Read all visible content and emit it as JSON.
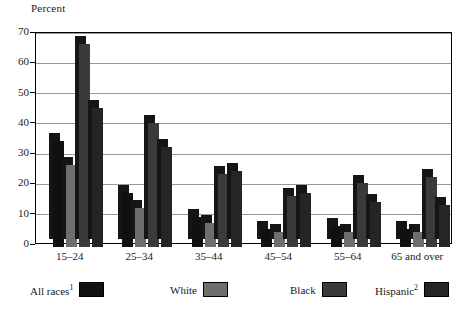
{
  "chart_data": {
    "type": "bar",
    "title": "",
    "ylabel": "Percent",
    "xlabel": "",
    "ylim": [
      0,
      70
    ],
    "yticks": [
      0,
      10,
      20,
      30,
      40,
      50,
      60,
      70
    ],
    "grid": true,
    "legend_position": "bottom",
    "categories": [
      "15–24",
      "25–34",
      "35–44",
      "45–54",
      "55–64",
      "65 and over"
    ],
    "series": [
      {
        "name": "All races",
        "footnote": "1",
        "color": "#101010",
        "values": [
          35,
          18,
          10,
          6,
          7,
          6
        ]
      },
      {
        "name": "White",
        "footnote": "",
        "color": "#6e6e6e",
        "values": [
          27,
          13,
          8,
          5,
          5,
          5
        ]
      },
      {
        "name": "Black",
        "footnote": "",
        "color": "#3a3a3a",
        "values": [
          67,
          41,
          24,
          17,
          21,
          23
        ]
      },
      {
        "name": "Hispanic",
        "footnote": "2",
        "color": "#252525",
        "values": [
          46,
          33,
          25,
          18,
          15,
          14
        ]
      }
    ]
  },
  "axis": {
    "y_title": "Percent",
    "tick_labels": [
      "70",
      "60",
      "50",
      "40",
      "30",
      "20",
      "10",
      "0"
    ],
    "category_labels": [
      "15–24",
      "25–34",
      "35–44",
      "45–54",
      "55–64",
      "65 and over"
    ]
  },
  "legend": {
    "entries": [
      {
        "label": "All races",
        "sup": "1",
        "color": "#101010"
      },
      {
        "label": "White",
        "sup": "",
        "color": "#6e6e6e"
      },
      {
        "label": "Black",
        "sup": "",
        "color": "#3a3a3a"
      },
      {
        "label": "Hispanic",
        "sup": "2",
        "color": "#252525"
      }
    ]
  }
}
